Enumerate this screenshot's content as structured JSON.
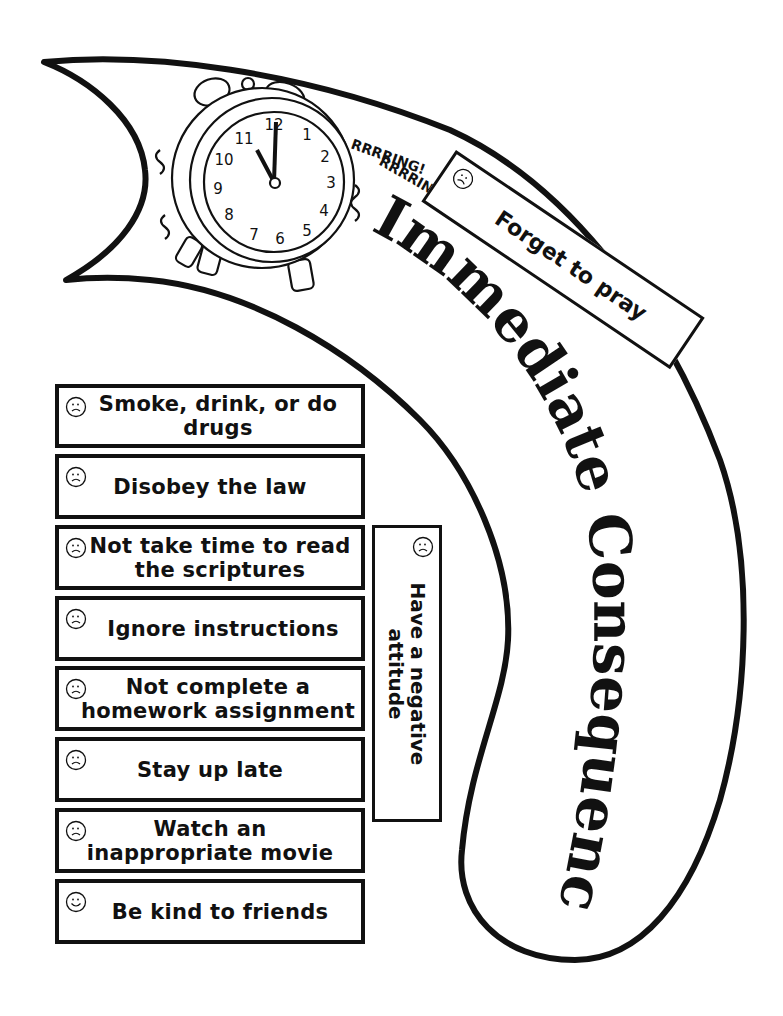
{
  "title": "Immediate Consequences",
  "clock": {
    "sound_line_1": "RRRRING!",
    "sound_line_2": "RRRRING!",
    "numbers": [
      "12",
      "1",
      "2",
      "3",
      "4",
      "5",
      "6",
      "7",
      "8",
      "9",
      "10",
      "11"
    ]
  },
  "tilted_card": {
    "label": "Forget to pray",
    "face": "sad-face-icon"
  },
  "vertical_card": {
    "label": "Have a negative attitude",
    "face": "sad-face-icon"
  },
  "cards": [
    {
      "label": "Smoke, drink, or do drugs",
      "face": "sad"
    },
    {
      "label": "Disobey the law",
      "face": "sad"
    },
    {
      "label": "Not take time to read the scriptures",
      "face": "sad"
    },
    {
      "label": "Ignore instructions",
      "face": "sad"
    },
    {
      "label": "Not complete a homework assignment",
      "face": "sad"
    },
    {
      "label": "Stay up late",
      "face": "sad"
    },
    {
      "label": "Watch an inappropriate movie",
      "face": "sad"
    },
    {
      "label": "Be kind to friends",
      "face": "happy"
    }
  ]
}
